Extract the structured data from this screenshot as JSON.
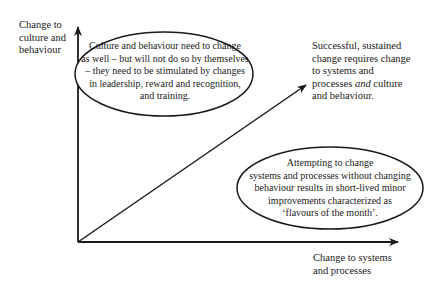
{
  "axes": {
    "y_label": [
      "Change to",
      "culture and",
      "behaviour"
    ],
    "x_label": [
      "Change to systems",
      "and processes"
    ]
  },
  "callouts": {
    "top_ellipse": [
      "Culture and behaviour need to change",
      "as well – but will not do so by themselves",
      "– they need to be stimulated by changes",
      "in leadership, reward and recognition,",
      "and training."
    ],
    "diagonal_note": {
      "line1": "Successful, sustained",
      "line2": "change requires change",
      "line3": "to systems and",
      "line4_pre": "processes ",
      "line4_em": "and",
      "line4_post": " culture",
      "line5": "and behaviour."
    },
    "bottom_ellipse": [
      "Attempting to change",
      "systems and processes without changing",
      "behaviour results in short-lived minor",
      "improvements characterized as",
      "‘flavours of the month’."
    ]
  },
  "colors": {
    "line": "#1a1a1a",
    "background": "#ffffff"
  }
}
